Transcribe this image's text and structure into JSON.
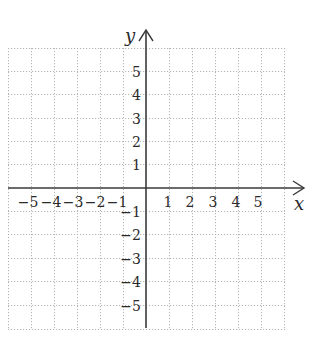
{
  "diagram": {
    "type": "coordinate-plane",
    "axis_labels": {
      "x": "x",
      "y": "y"
    },
    "x_range": [
      -6,
      6
    ],
    "y_range": [
      -6,
      6
    ],
    "x_ticks": {
      "negative": [
        "−5",
        "−4",
        "−3",
        "−2",
        "−1"
      ],
      "positive": [
        "1",
        "2",
        "3",
        "4",
        "5"
      ]
    },
    "y_ticks": {
      "positive": [
        "5",
        "4",
        "3",
        "2",
        "1"
      ],
      "negative": [
        "−1",
        "−2",
        "−3",
        "−4",
        "−5"
      ]
    },
    "colors": {
      "background": "#ffffff",
      "grid": "#b5b5b5",
      "axis": "#3a3a3a",
      "text": "#2a2a2a"
    }
  }
}
